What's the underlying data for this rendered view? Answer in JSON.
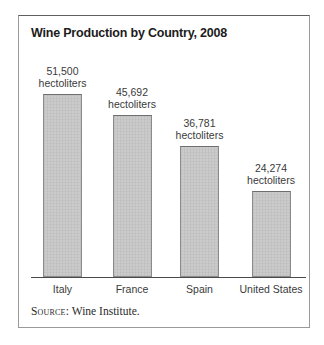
{
  "figure": {
    "title": "Wine Production by Country, 2008",
    "source_prefix": "Source:",
    "source_text": "Wine Institute."
  },
  "chart_data": {
    "type": "bar",
    "title": "Wine Production by Country, 2008",
    "categories": [
      "Italy",
      "France",
      "Spain",
      "United States"
    ],
    "values": [
      51500,
      45692,
      36781,
      24274
    ],
    "value_labels": [
      "51,500",
      "45,692",
      "36,781",
      "24,274"
    ],
    "unit_label": "hectoliters",
    "xlabel": "",
    "ylabel": "",
    "ylim": [
      0,
      55000
    ],
    "grid": false,
    "legend": "none",
    "annotations": "each bar labeled above with value and unit",
    "source": "Source: Wine Institute.",
    "bar_fill_color": "#cbcbcb",
    "bar_border_color": "#8b8b8b",
    "axis_color": "#4a4a4a",
    "text_color": "#3a3a3a"
  }
}
